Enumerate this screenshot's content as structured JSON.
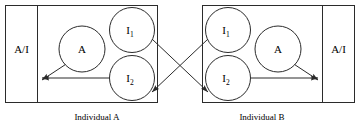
{
  "figure": {
    "type": "diagram",
    "stroke_color": "#2b2b2b",
    "text_color": "#000000",
    "background_color": "#ffffff"
  },
  "left_panel": {
    "channel_label": "A/I",
    "caption": "Individual A",
    "nodes": {
      "a": "A",
      "i1_base": "I",
      "i1_sub": "1",
      "i2_base": "I",
      "i2_sub": "2"
    }
  },
  "right_panel": {
    "channel_label": "A/I",
    "caption": "Individual B",
    "nodes": {
      "a": "A",
      "i1_base": "I",
      "i1_sub": "1",
      "i2_base": "I",
      "i2_sub": "2"
    }
  }
}
